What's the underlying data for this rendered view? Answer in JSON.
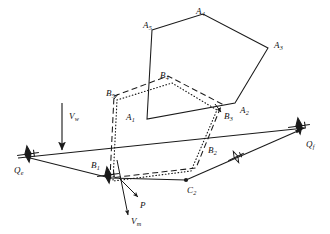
{
  "figure": {
    "type": "technical-line-diagram",
    "background_color": "#ffffff",
    "stroke_color": "#1a1a1a",
    "width": 330,
    "height": 234
  },
  "labels": {
    "A1": {
      "base": "A",
      "sub": "1",
      "x": 126,
      "y": 113
    },
    "A2": {
      "base": "A",
      "sub": "2",
      "x": 240,
      "y": 106
    },
    "A3": {
      "base": "A",
      "sub": "3",
      "x": 274,
      "y": 41
    },
    "A4": {
      "base": "A",
      "sub": "4",
      "x": 196,
      "y": 7
    },
    "A5": {
      "base": "A",
      "sub": "5",
      "x": 143,
      "y": 21
    },
    "B1": {
      "base": "B",
      "sub": "1",
      "x": 91,
      "y": 161
    },
    "B2": {
      "base": "B",
      "sub": "2",
      "x": 208,
      "y": 146
    },
    "B3": {
      "base": "B",
      "sub": "3",
      "x": 224,
      "y": 112
    },
    "B4": {
      "base": "B",
      "sub": "4",
      "x": 160,
      "y": 71
    },
    "B5": {
      "base": "B",
      "sub": "5",
      "x": 106,
      "y": 89
    },
    "C2": {
      "base": "C",
      "sub": "2",
      "x": 187,
      "y": 186
    },
    "P": {
      "base": "P",
      "sub": "",
      "x": 140,
      "y": 201
    },
    "Qe": {
      "base": "Q",
      "sub": "e",
      "x": 14,
      "y": 166
    },
    "Qf": {
      "base": "Q",
      "sub": "f",
      "x": 306,
      "y": 140
    },
    "Vw": {
      "base": "V",
      "sub": "w",
      "x": 69,
      "y": 112
    },
    "Vm": {
      "base": "V",
      "sub": "m",
      "x": 131,
      "y": 217
    }
  },
  "geometry": {
    "pentagon_A": {
      "style": "solid",
      "label": "search-area-pentagon",
      "points": "152,30 203,14 268,48 235,103 147,119"
    },
    "polygon_B_dashed": {
      "style": "dashed",
      "label": "dashed-coverage-polygon",
      "points": "114,95 168,76 221,104 196,167 110,177"
    },
    "polygon_B_dotted": {
      "style": "dotted",
      "label": "dotted-coverage-polygon",
      "points": "116,99 171,83 217,110 191,170 112,180"
    },
    "route_line_main": {
      "style": "solid",
      "label": "sensor-baseline-Qe-Qf",
      "from": "22,157",
      "to": "303,129"
    },
    "route_lower_leg_1": {
      "style": "solid",
      "label": "track-leg-Qe-B1",
      "from": "30,157",
      "to": "110,178"
    },
    "route_lower_leg_2": {
      "style": "solid",
      "label": "track-leg-B1-C2",
      "from": "110,178",
      "to": "186,180"
    },
    "route_lower_leg_3": {
      "style": "solid",
      "label": "track-leg-C2-Qf",
      "from": "186,180",
      "to": "300,130"
    },
    "wind_arrow": {
      "style": "solid-arrow",
      "label": "wind-velocity-vector",
      "from": "62,105",
      "to": "62,148"
    },
    "target_arrow": {
      "style": "solid-arrow",
      "label": "target-velocity-vector",
      "from": "118,160",
      "to": "128,213"
    },
    "p_marker_arrow": {
      "style": "solid-arrow",
      "label": "point-P-indicator",
      "from": "118,176",
      "to": "137,197"
    },
    "b3_tick_arrow": {
      "style": "solid-arrow",
      "label": "B3-leader",
      "from": "216,105",
      "to": "222,113"
    },
    "qf_arrowhead": {
      "style": "arrow",
      "label": "heading-arrow-Qf"
    }
  },
  "aircraft_icons": [
    {
      "name": "aircraft-icon-Qe",
      "x": 28,
      "y": 152,
      "rotation": -8
    },
    {
      "name": "aircraft-icon-B1",
      "x": 107,
      "y": 173,
      "rotation": -8
    },
    {
      "name": "aircraft-icon-mid",
      "x": 235,
      "y": 157,
      "rotation": -24
    },
    {
      "name": "aircraft-icon-Qf",
      "x": 299,
      "y": 125,
      "rotation": -8
    }
  ],
  "node_dots": [
    {
      "name": "node-dot-C2",
      "x": 186,
      "y": 180
    }
  ]
}
